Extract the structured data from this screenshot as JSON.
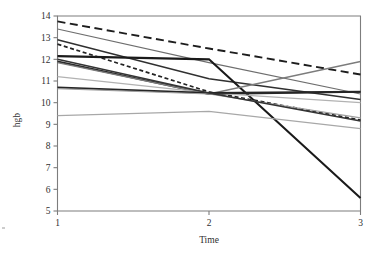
{
  "chart_data": {
    "type": "line",
    "title": "",
    "subtitle": "",
    "xlabel": "Time",
    "ylabel": "hgb",
    "x": [
      1,
      2,
      3
    ],
    "xtick_labels": [
      "1",
      "2",
      "3"
    ],
    "ytick_labels": [
      "5",
      "6",
      "7",
      "8",
      "9",
      "10",
      "11",
      "12",
      "13",
      "14"
    ],
    "ytick_values": [
      5,
      6,
      7,
      8,
      9,
      10,
      11,
      12,
      13,
      14
    ],
    "xlim": [
      1,
      3
    ],
    "ylim": [
      5,
      14
    ],
    "grid": false,
    "legend": "none",
    "annotations": [],
    "series": [
      {
        "name": "subject-1",
        "values": [
          13.75,
          12.5,
          11.3
        ],
        "color": "#1d1d1d",
        "width": 1.9,
        "dash": "long-dash"
      },
      {
        "name": "subject-2",
        "values": [
          13.4,
          11.85,
          10.4
        ],
        "color": "#6e6e6e",
        "width": 1.2,
        "dash": "solid"
      },
      {
        "name": "subject-3",
        "values": [
          12.9,
          11.1,
          10.15
        ],
        "color": "#303030",
        "width": 1.5,
        "dash": "solid"
      },
      {
        "name": "subject-4",
        "values": [
          12.7,
          10.5,
          9.2
        ],
        "color": "#232323",
        "width": 1.7,
        "dash": "short-dash"
      },
      {
        "name": "subject-5",
        "values": [
          12.15,
          12.0,
          5.6
        ],
        "color": "#1a1a1a",
        "width": 2.1,
        "dash": "solid"
      },
      {
        "name": "subject-6",
        "values": [
          11.9,
          10.4,
          10.5
        ],
        "color": "#2a2a2a",
        "width": 1.8,
        "dash": "solid"
      },
      {
        "name": "subject-7",
        "values": [
          11.85,
          10.4,
          11.9
        ],
        "color": "#7c7c7c",
        "width": 1.3,
        "dash": "solid"
      },
      {
        "name": "subject-8",
        "values": [
          11.2,
          10.45,
          10.0
        ],
        "color": "#b2b2b2",
        "width": 1.2,
        "dash": "solid"
      },
      {
        "name": "subject-9",
        "values": [
          10.7,
          10.45,
          10.5
        ],
        "color": "#262626",
        "width": 2.0,
        "dash": "solid"
      },
      {
        "name": "subject-10",
        "values": [
          10.65,
          10.4,
          9.3
        ],
        "color": "#9f9f9f",
        "width": 1.2,
        "dash": "solid"
      },
      {
        "name": "subject-11",
        "values": [
          9.4,
          9.6,
          8.8
        ],
        "color": "#a8a8a8",
        "width": 1.3,
        "dash": "solid"
      },
      {
        "name": "subject-12",
        "values": [
          12.0,
          10.45,
          9.15
        ],
        "color": "#343434",
        "width": 1.6,
        "dash": "solid"
      }
    ]
  }
}
